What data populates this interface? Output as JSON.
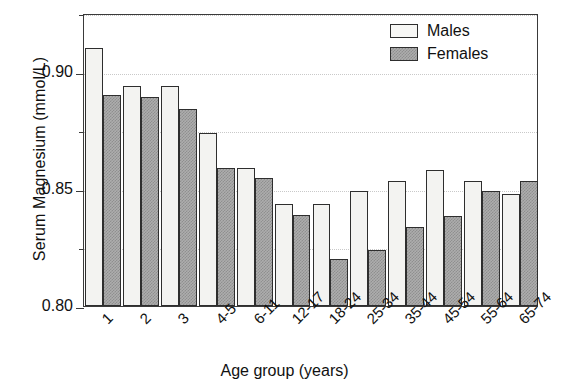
{
  "chart_data": {
    "type": "bar",
    "title": "",
    "xlabel": "Age group (years)",
    "ylabel": "Serum Magnesium (mmol/L)",
    "categories": [
      "1",
      "2",
      "3",
      "4-5",
      "6-11",
      "12-17",
      "18-24",
      "25-34",
      "35-44",
      "45-54",
      "55-64",
      "65-74"
    ],
    "series": [
      {
        "name": "Males",
        "values": [
          0.91,
          0.894,
          0.894,
          0.874,
          0.859,
          0.8435,
          0.8435,
          0.849,
          0.8535,
          0.858,
          0.8535,
          0.848
        ]
      },
      {
        "name": "Females",
        "values": [
          0.89,
          0.889,
          0.884,
          0.859,
          0.8545,
          0.839,
          0.82,
          0.824,
          0.8335,
          0.8385,
          0.849,
          0.8535
        ]
      }
    ],
    "ylim": [
      0.8,
      0.925
    ],
    "yticks": [
      "0.80",
      "0.85",
      "0.90"
    ],
    "ytick_values": [
      0.8,
      0.85,
      0.9
    ],
    "yminor_values": [
      0.825,
      0.875,
      0.925
    ],
    "grid": "horizontal-dotted",
    "legend_position": "top-right",
    "colors": {
      "males_fill": "#f3f3f1",
      "females_fill": "#adadad",
      "bar_outline": "#2e2e2e",
      "grid": "#c9c9c9",
      "frame": "#3a3a3a",
      "text": "#111111"
    }
  },
  "legend": {
    "items": [
      {
        "label": "Males",
        "swatch": "males-swatch"
      },
      {
        "label": "Females",
        "swatch": "females-swatch"
      }
    ]
  }
}
